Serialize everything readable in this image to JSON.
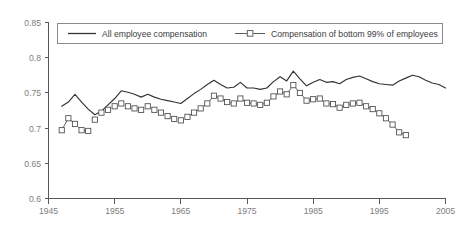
{
  "chart_data": {
    "type": "line",
    "title": "",
    "subtitle": "",
    "xlabel": "",
    "ylabel": "",
    "xlim": [
      1945,
      2005
    ],
    "ylim": [
      0.6,
      0.85
    ],
    "grid": false,
    "legend_position": "top",
    "x_ticks": [
      "1945",
      "1955",
      "1965",
      "1975",
      "1985",
      "1995",
      "2005"
    ],
    "x_tick_values": [
      1945,
      1955,
      1965,
      1975,
      1985,
      1995,
      2005
    ],
    "y_ticks": [
      "0.6",
      "0.65",
      "0.7",
      "0.75",
      "0.8",
      "0.85"
    ],
    "y_tick_values": [
      0.6,
      0.65,
      0.7,
      0.75,
      0.8,
      0.85
    ],
    "series": [
      {
        "name": "All employee compensation",
        "style": "solid-line",
        "marker": "none",
        "color": "#333333",
        "x": [
          1947,
          1948,
          1949,
          1950,
          1951,
          1952,
          1953,
          1954,
          1955,
          1956,
          1957,
          1958,
          1959,
          1960,
          1961,
          1962,
          1963,
          1964,
          1965,
          1966,
          1967,
          1968,
          1969,
          1970,
          1971,
          1972,
          1973,
          1974,
          1975,
          1976,
          1977,
          1978,
          1979,
          1980,
          1981,
          1982,
          1983,
          1984,
          1985,
          1986,
          1987,
          1988,
          1989,
          1990,
          1991,
          1992,
          1993,
          1994,
          1995,
          1996,
          1997,
          1998,
          1999,
          2000,
          2001,
          2002,
          2003,
          2004,
          2005
        ],
        "values": [
          0.731,
          0.737,
          0.748,
          0.737,
          0.727,
          0.719,
          0.724,
          0.733,
          0.742,
          0.753,
          0.751,
          0.748,
          0.744,
          0.748,
          0.744,
          0.741,
          0.739,
          0.737,
          0.735,
          0.742,
          0.749,
          0.755,
          0.762,
          0.768,
          0.762,
          0.757,
          0.758,
          0.765,
          0.757,
          0.757,
          0.755,
          0.757,
          0.766,
          0.773,
          0.767,
          0.781,
          0.77,
          0.76,
          0.765,
          0.769,
          0.765,
          0.766,
          0.763,
          0.769,
          0.772,
          0.774,
          0.77,
          0.766,
          0.763,
          0.762,
          0.761,
          0.767,
          0.771,
          0.775,
          0.773,
          0.768,
          0.764,
          0.762,
          0.757
        ]
      },
      {
        "name": "Compensation of bottom 99% of employees",
        "style": "square-marker-line",
        "marker": "square-open",
        "color": "#4a4a4a",
        "x": [
          1947,
          1948,
          1949,
          1950,
          1951,
          1952,
          1953,
          1954,
          1955,
          1956,
          1957,
          1958,
          1959,
          1960,
          1961,
          1962,
          1963,
          1964,
          1965,
          1966,
          1967,
          1968,
          1969,
          1970,
          1971,
          1972,
          1973,
          1974,
          1975,
          1976,
          1977,
          1978,
          1979,
          1980,
          1981,
          1982,
          1983,
          1984,
          1985,
          1986,
          1987,
          1988,
          1989,
          1990,
          1991,
          1992,
          1993,
          1994,
          1995,
          1996,
          1997,
          1998,
          1999
        ],
        "values": [
          0.697,
          0.714,
          0.706,
          0.697,
          0.696,
          0.712,
          0.722,
          0.726,
          0.731,
          0.735,
          0.731,
          0.728,
          0.726,
          0.731,
          0.726,
          0.722,
          0.717,
          0.713,
          0.711,
          0.716,
          0.722,
          0.728,
          0.735,
          0.746,
          0.742,
          0.737,
          0.735,
          0.742,
          0.736,
          0.735,
          0.733,
          0.736,
          0.745,
          0.752,
          0.748,
          0.761,
          0.75,
          0.739,
          0.741,
          0.742,
          0.735,
          0.734,
          0.729,
          0.733,
          0.735,
          0.736,
          0.731,
          0.727,
          0.721,
          0.714,
          0.705,
          0.694,
          0.69
        ],
        "gap_note": "markers plotted without connecting line from 1952 through 1965"
      }
    ]
  },
  "legend": {
    "entry_1_label": "All employee compensation",
    "entry_2_label": "Compensation of bottom 99% of employees"
  },
  "axes": {
    "y_labels": [
      "0.85",
      "0.8",
      "0.75",
      "0.7",
      "0.65",
      "0.6"
    ],
    "x_labels": [
      "1945",
      "1955",
      "1965",
      "1975",
      "1985",
      "1995",
      "2005"
    ]
  }
}
